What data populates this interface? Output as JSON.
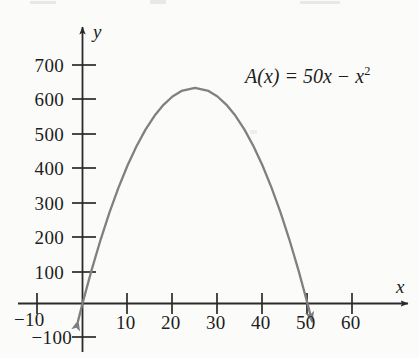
{
  "figure": {
    "equation_label": "A(x) = 50x − x",
    "equation_exponent": "2",
    "equation_plain": "A(x) = 50x − x²",
    "x_axis_name": "x",
    "y_axis_name": "y",
    "curve_color": "#808080",
    "axis_color": "#2a2a2a",
    "text_color": "#1d1d1d",
    "background_color": "#fbfbf9"
  },
  "chart_data": {
    "type": "line",
    "title": "",
    "subtitle": "",
    "xlabel": "x",
    "ylabel": "y",
    "annotations": [
      "A(x) = 50x − x²"
    ],
    "legend": [],
    "legend_position": "none",
    "grid": false,
    "xlim": [
      -14,
      74
    ],
    "ylim": [
      -180,
      760
    ],
    "xticks": [
      -10,
      10,
      20,
      30,
      40,
      50,
      60
    ],
    "xtick_labels": [
      "−10",
      "10",
      "20",
      "30",
      "40",
      "50",
      "60"
    ],
    "yticks": [
      -100,
      100,
      200,
      300,
      400,
      500,
      600,
      700
    ],
    "ytick_labels": [
      "−100",
      "100",
      "200",
      "300",
      "400",
      "500",
      "600",
      "700"
    ],
    "series": [
      {
        "name": "A(x) = 50x − x²",
        "formula": "50*x - x^2",
        "color": "#808080",
        "vertex": [
          25,
          625
        ],
        "roots": [
          0,
          50
        ],
        "arrow_start": true,
        "arrow_end": true,
        "x": [
          -1,
          0,
          2,
          4,
          6,
          8,
          10,
          12,
          14,
          16,
          18,
          20,
          22,
          25,
          28,
          30,
          32,
          34,
          36,
          38,
          40,
          42,
          44,
          46,
          48,
          50,
          51
        ],
        "y": [
          -51,
          0,
          96,
          184,
          264,
          336,
          400,
          456,
          504,
          544,
          576,
          600,
          616,
          625,
          616,
          600,
          576,
          544,
          504,
          456,
          400,
          336,
          264,
          184,
          96,
          0,
          -51
        ]
      }
    ]
  },
  "axis_ticks": {
    "y": [
      {
        "value": "700",
        "px": 65
      },
      {
        "value": "600",
        "px": 99
      },
      {
        "value": "500",
        "px": 134
      },
      {
        "value": "400",
        "px": 168
      },
      {
        "value": "300",
        "px": 203
      },
      {
        "value": "200",
        "px": 237
      },
      {
        "value": "100",
        "px": 272
      },
      {
        "value": "−100",
        "px": 337
      }
    ],
    "x": [
      {
        "value": "−10",
        "px": 37
      },
      {
        "value": "10",
        "px": 127
      },
      {
        "value": "20",
        "px": 172
      },
      {
        "value": "30",
        "px": 217
      },
      {
        "value": "40",
        "px": 262
      },
      {
        "value": "50",
        "px": 307
      },
      {
        "value": "60",
        "px": 352
      }
    ]
  }
}
